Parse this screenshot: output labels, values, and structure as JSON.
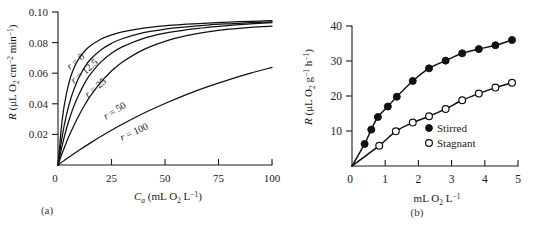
{
  "figure": {
    "background": "#ffffff",
    "ink_color": "#111111"
  },
  "panels": [
    {
      "id": "a",
      "label": "(a)"
    },
    {
      "id": "b",
      "label": "(b)"
    }
  ],
  "chart_data": [
    {
      "type": "line",
      "panel": "(a)",
      "title": "",
      "xlabel": "C_a (mL O2 L^-1)",
      "xlabel_parts": {
        "sym": "C",
        "sym_sub": "a",
        "unit_pre": " (mL O",
        "unit_sub": "2",
        "unit_mid": " L",
        "unit_sup": "−1",
        "unit_post": ")"
      },
      "ylabel": "R (μL O2 cm^-2 min^-1)",
      "ylabel_parts": {
        "sym": "R",
        "unit_pre": " (μL O",
        "unit_sub": "2",
        "unit_mid": " cm",
        "unit_sup1": "−2",
        "unit_mid2": " min",
        "unit_sup2": "−1",
        "unit_post": ")"
      },
      "xlim": [
        0,
        100
      ],
      "ylim": [
        0,
        0.1
      ],
      "xticks": [
        0,
        25,
        50,
        75,
        100
      ],
      "xticklabels": [
        "0",
        "25",
        "50",
        "75",
        "100"
      ],
      "yticks": [
        0,
        0.02,
        0.04,
        0.06,
        0.08,
        0.1
      ],
      "yticklabels": [
        "0",
        "0.02",
        "0.04",
        "0.06",
        "0.08",
        "0.10"
      ],
      "grid": false,
      "legend": "inline-curve-labels",
      "series": [
        {
          "name": "r = 0",
          "label": "r = 0",
          "label_r": "r",
          "label_rest": " = 0",
          "r_value": 0,
          "x": [
            0,
            2,
            4,
            6,
            8,
            10,
            12.5,
            15,
            20,
            25,
            30,
            40,
            50,
            60,
            70,
            80,
            90,
            100
          ],
          "y": [
            0,
            0.03,
            0.047,
            0.058,
            0.065,
            0.07,
            0.0745,
            0.0778,
            0.0822,
            0.085,
            0.087,
            0.0895,
            0.091,
            0.092,
            0.0928,
            0.0934,
            0.0939,
            0.0943
          ]
        },
        {
          "name": "r = 12.5",
          "label": "r = 12.5",
          "label_r": "r",
          "label_rest": " = 12.5",
          "r_value": 12.5,
          "x": [
            0,
            2,
            4,
            6,
            8,
            10,
            12.5,
            15,
            20,
            25,
            30,
            40,
            50,
            60,
            70,
            80,
            90,
            100
          ],
          "y": [
            0,
            0.019,
            0.033,
            0.0435,
            0.0515,
            0.0578,
            0.064,
            0.0688,
            0.0752,
            0.0795,
            0.0825,
            0.0865,
            0.0888,
            0.0903,
            0.0915,
            0.0923,
            0.093,
            0.0936
          ]
        },
        {
          "name": "r = 25",
          "label": "r = 25",
          "label_r": "r",
          "label_rest": " = 25",
          "r_value": 25,
          "x": [
            0,
            2,
            4,
            6,
            8,
            10,
            12.5,
            15,
            20,
            25,
            30,
            40,
            50,
            60,
            70,
            80,
            90,
            100
          ],
          "y": [
            0,
            0.013,
            0.024,
            0.033,
            0.0405,
            0.0468,
            0.0535,
            0.059,
            0.0672,
            0.073,
            0.0772,
            0.0828,
            0.0862,
            0.0884,
            0.09,
            0.0912,
            0.0922,
            0.093
          ]
        },
        {
          "name": "r = 50",
          "label": "r = 50",
          "label_r": "r",
          "label_rest": " = 50",
          "r_value": 50,
          "x": [
            0,
            2,
            4,
            6,
            8,
            10,
            12.5,
            15,
            20,
            25,
            30,
            40,
            50,
            60,
            70,
            80,
            90,
            100
          ],
          "y": [
            0,
            0.0078,
            0.015,
            0.0215,
            0.0275,
            0.033,
            0.0392,
            0.0448,
            0.054,
            0.0614,
            0.0672,
            0.0754,
            0.0808,
            0.0845,
            0.087,
            0.0888,
            0.09,
            0.0908
          ]
        },
        {
          "name": "r = 100",
          "label": "r = 100",
          "label_r": "r",
          "label_rest": " = 100",
          "r_value": 100,
          "x": [
            0,
            5,
            10,
            15,
            20,
            25,
            30,
            40,
            50,
            60,
            70,
            80,
            90,
            100
          ],
          "y": [
            0,
            0.005,
            0.0098,
            0.0143,
            0.0186,
            0.0227,
            0.0266,
            0.0338,
            0.0402,
            0.046,
            0.0512,
            0.0558,
            0.06,
            0.0638
          ]
        }
      ]
    },
    {
      "type": "scatter",
      "panel": "(b)",
      "title": "",
      "xlabel": "mL O2 L^-1",
      "xlabel_parts": {
        "pre": "mL O",
        "sub": "2",
        "mid": " L",
        "sup": "−1"
      },
      "ylabel": "R (μL O2 g^-1 h^-1)",
      "ylabel_parts": {
        "sym": "R",
        "unit_pre": " (μL O",
        "unit_sub": "2",
        "unit_mid": " g",
        "unit_sup1": "−1",
        "unit_mid2": " h",
        "unit_sup2": "−1",
        "unit_post": ")"
      },
      "xlim": [
        0,
        5
      ],
      "ylim": [
        0,
        40
      ],
      "xticks": [
        0,
        1,
        2,
        3,
        4,
        5
      ],
      "xticklabels": [
        "0",
        "1",
        "2",
        "3",
        "4",
        "5"
      ],
      "yticks": [
        0,
        10,
        20,
        30,
        40
      ],
      "yticklabels": [
        "0",
        "10",
        "20",
        "30",
        "40"
      ],
      "grid": false,
      "legend_position": "inside-lower-right",
      "series": [
        {
          "name": "Stirred",
          "marker": "filled-circle",
          "x": [
            0.38,
            0.58,
            0.78,
            1.08,
            1.35,
            1.83,
            2.32,
            2.82,
            3.32,
            3.82,
            4.32,
            4.82
          ],
          "y": [
            6.3,
            10.4,
            14.0,
            17.0,
            19.8,
            24.3,
            27.9,
            30.1,
            32.2,
            33.4,
            34.5,
            36.0
          ]
        },
        {
          "name": "Stagnant",
          "marker": "open-circle",
          "x": [
            0.82,
            1.32,
            1.83,
            2.32,
            2.82,
            3.32,
            3.82,
            4.32,
            4.82
          ],
          "y": [
            5.8,
            9.9,
            12.4,
            14.2,
            16.3,
            18.8,
            20.7,
            22.4,
            23.8
          ]
        }
      ],
      "legend_entries": [
        {
          "label": "Stirred",
          "marker": "filled-circle"
        },
        {
          "label": "Stagnant",
          "marker": "open-circle"
        }
      ]
    }
  ]
}
